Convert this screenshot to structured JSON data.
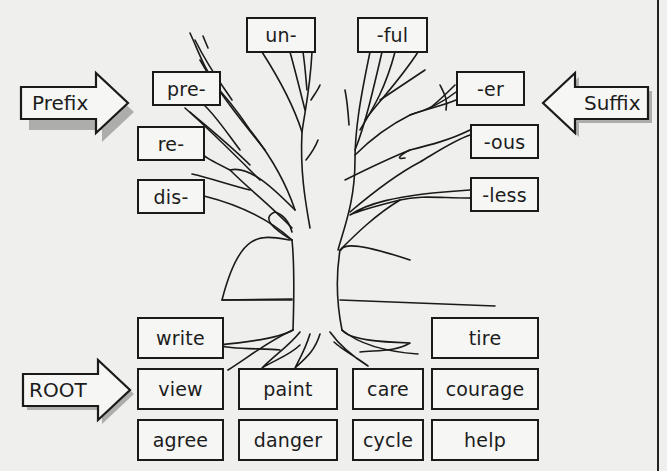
{
  "diagram": {
    "type": "word-structure tree",
    "arrows": {
      "prefix": {
        "label": "Prefix",
        "direction": "right"
      },
      "suffix": {
        "label": "Suffix",
        "direction": "left"
      },
      "root": {
        "label": "ROOT",
        "direction": "right"
      }
    },
    "prefixes": [
      "un-",
      "pre-",
      "re-",
      "dis-"
    ],
    "suffixes": [
      "-ful",
      "-er",
      "-ous",
      "-less"
    ],
    "roots": {
      "row1": [
        "write",
        "tire"
      ],
      "row2": [
        "view",
        "paint",
        "care",
        "courage"
      ],
      "row3": [
        "agree",
        "danger",
        "cycle",
        "help"
      ]
    }
  }
}
